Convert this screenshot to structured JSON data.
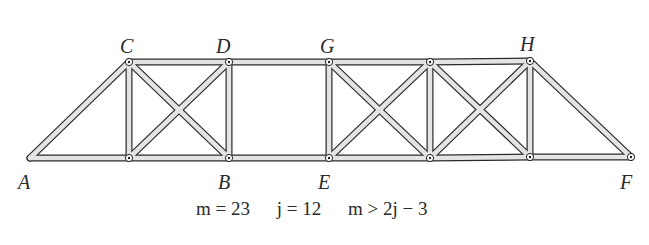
{
  "figure": {
    "type": "truss",
    "joints": [
      {
        "id": "A",
        "label": "A",
        "x": 30,
        "y": 158,
        "label_x": 18,
        "label_y": 172,
        "pinned": false
      },
      {
        "id": "C",
        "label": "C",
        "x": 129,
        "y": 62,
        "label_x": 120,
        "label_y": 36,
        "pinned": true
      },
      {
        "id": "D",
        "label": "D",
        "x": 229,
        "y": 62,
        "label_x": 216,
        "label_y": 36,
        "pinned": true
      },
      {
        "id": "G",
        "label": "G",
        "x": 329,
        "y": 62,
        "label_x": 320,
        "label_y": 36,
        "pinned": true
      },
      {
        "id": "T4",
        "label": "",
        "x": 430,
        "y": 62,
        "pinned": true
      },
      {
        "id": "H",
        "label": "H",
        "x": 530,
        "y": 61,
        "label_x": 520,
        "label_y": 34,
        "pinned": true
      },
      {
        "id": "L1",
        "label": "",
        "x": 129,
        "y": 158,
        "pinned": true
      },
      {
        "id": "B",
        "label": "B",
        "x": 229,
        "y": 158,
        "label_x": 218,
        "label_y": 172,
        "pinned": true
      },
      {
        "id": "E",
        "label": "E",
        "x": 329,
        "y": 158,
        "label_x": 318,
        "label_y": 172,
        "pinned": true
      },
      {
        "id": "L4",
        "label": "",
        "x": 430,
        "y": 158,
        "pinned": true
      },
      {
        "id": "L5",
        "label": "",
        "x": 530,
        "y": 157,
        "pinned": true
      },
      {
        "id": "F",
        "label": "F",
        "x": 631,
        "y": 157,
        "label_x": 620,
        "label_y": 172,
        "pinned": true
      }
    ],
    "members": [
      [
        "A",
        "C"
      ],
      [
        "A",
        "L1"
      ],
      [
        "C",
        "D"
      ],
      [
        "D",
        "G"
      ],
      [
        "G",
        "T4"
      ],
      [
        "T4",
        "H"
      ],
      [
        "L1",
        "B"
      ],
      [
        "B",
        "E"
      ],
      [
        "E",
        "L4"
      ],
      [
        "L4",
        "L5"
      ],
      [
        "L5",
        "F"
      ],
      [
        "C",
        "L1"
      ],
      [
        "D",
        "B"
      ],
      [
        "G",
        "E"
      ],
      [
        "T4",
        "L4"
      ],
      [
        "H",
        "L5"
      ],
      [
        "C",
        "B"
      ],
      [
        "D",
        "L1"
      ],
      [
        "G",
        "L4"
      ],
      [
        "T4",
        "E"
      ],
      [
        "T4",
        "L5"
      ],
      [
        "H",
        "L4"
      ],
      [
        "H",
        "F"
      ]
    ],
    "caption": {
      "m": "m = 23",
      "j": "j = 12",
      "condition": "m > 2j − 3"
    }
  }
}
